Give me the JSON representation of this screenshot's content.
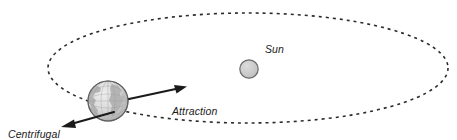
{
  "figure": {
    "kind": "orbital-force-diagram",
    "background_color": "#ffffff",
    "width": 457,
    "height": 140
  },
  "labels": {
    "sun": "Sun",
    "attraction_line1": "Attraction",
    "attraction_line2": "from the Sun",
    "centrifugal_line1": "Centrifugal",
    "centrifugal_line2": "force"
  },
  "bodies": {
    "sun": {
      "name": "Sun",
      "cx": 249,
      "cy": 69,
      "r": 9,
      "fill": "#c9c9c9",
      "stroke": "#6b6b6b"
    },
    "earth": {
      "name": "Earth",
      "cx": 108,
      "cy": 101,
      "r": 20,
      "fill": "#d5d5d5",
      "stroke": "#6e6e6e",
      "land_fill": "#b9b9b9",
      "ocean_fill": "#e2e2e2"
    }
  },
  "orbit": {
    "name": "orbit-ellipse",
    "cx": 248,
    "cy": 68,
    "rx": 200,
    "ry": 55,
    "stroke": "#2b2b2b",
    "stroke_width": 1.5,
    "dash": "3 4"
  },
  "arrows": {
    "attraction": {
      "name": "attraction-arrow",
      "from_x": 129,
      "from_y": 99,
      "to_x": 186,
      "to_y": 87,
      "color": "#1a1a1a"
    },
    "centrifugal": {
      "name": "centrifugal-arrow",
      "from_x": 113,
      "from_y": 113,
      "to_x": 62,
      "to_y": 127,
      "color": "#1a1a1a"
    }
  },
  "colors": {
    "ink": "#1a1a1a",
    "orbit_stroke": "#2b2b2b",
    "sun_fill": "#c9c9c9",
    "earth_fill": "#d5d5d5"
  }
}
